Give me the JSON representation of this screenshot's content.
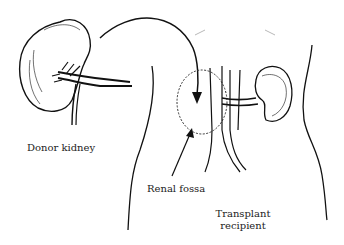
{
  "diagram": {
    "labels": {
      "donor_kidney": "Donor kidney",
      "renal_fossa": "Renal fossa",
      "transplant_recipient_line1": "Transplant",
      "transplant_recipient_line2": "recipient"
    },
    "colors": {
      "ink": "#111111",
      "background": "#ffffff"
    }
  }
}
